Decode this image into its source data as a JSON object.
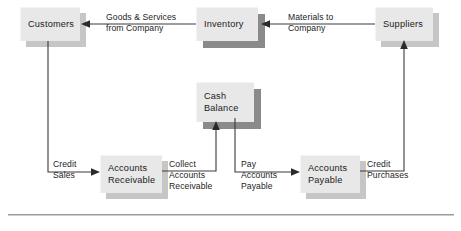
{
  "diagram": {
    "colors": {
      "box_face": "#e8e8e8",
      "box_shadow_light": "#c6c6c6",
      "box_shadow_dark": "#8a8a8a",
      "line": "#3a3a3a",
      "text": "#1b1b1b",
      "rule": "#9a9a9a",
      "background": "#ffffff"
    },
    "nodes": [
      {
        "id": "customers",
        "lines": [
          "Customers"
        ],
        "x": 20,
        "y": 7,
        "w": 60,
        "h": 34,
        "shadow": "light"
      },
      {
        "id": "inventory",
        "lines": [
          "Inventory"
        ],
        "x": 196,
        "y": 7,
        "w": 62,
        "h": 34,
        "shadow": "dark"
      },
      {
        "id": "suppliers",
        "lines": [
          "Suppliers"
        ],
        "x": 375,
        "y": 7,
        "w": 58,
        "h": 34,
        "shadow": "light"
      },
      {
        "id": "cash-balance",
        "lines": [
          "Cash",
          "Balance"
        ],
        "x": 196,
        "y": 82,
        "w": 58,
        "h": 40,
        "shadow": "dark"
      },
      {
        "id": "accounts-receivable",
        "lines": [
          "Accounts",
          "Receivable"
        ],
        "x": 100,
        "y": 155,
        "w": 62,
        "h": 38,
        "shadow": "light"
      },
      {
        "id": "accounts-payable",
        "lines": [
          "Accounts",
          "Payable"
        ],
        "x": 300,
        "y": 155,
        "w": 60,
        "h": 38,
        "shadow": "light"
      }
    ],
    "edge_labels": [
      {
        "id": "goods-and-services-from-company",
        "lines": [
          "Goods & Services",
          "from Company"
        ],
        "x": 106,
        "y": 13
      },
      {
        "id": "materials-to-company",
        "lines": [
          "Materials to",
          "Company"
        ],
        "x": 288,
        "y": 13
      },
      {
        "id": "credit-sales",
        "lines": [
          "Credit",
          "Sales"
        ],
        "x": 52,
        "y": 158
      },
      {
        "id": "collect-accounts-receivable",
        "lines": [
          "Collect",
          "Accounts",
          "Receivable"
        ],
        "x": 170,
        "y": 158
      },
      {
        "id": "pay-accounts-payable",
        "lines": [
          "Pay",
          "Accounts",
          "Payable"
        ],
        "x": 241,
        "y": 158
      },
      {
        "id": "credit-purchases",
        "lines": [
          "Credit",
          "Purchases"
        ],
        "x": 368,
        "y": 158
      }
    ],
    "edges": [
      {
        "id": "inventory-to-customers",
        "from": "inventory",
        "to": "customers",
        "label": "Goods & Services from Company",
        "path": "M 196 24 L 84 24",
        "arrow_at": "end",
        "arrow_dir": "left"
      },
      {
        "id": "suppliers-to-inventory",
        "from": "suppliers",
        "to": "inventory",
        "label": "Materials to Company",
        "path": "M 375 24 L 265 24",
        "arrow_at": "end",
        "arrow_dir": "left"
      },
      {
        "id": "customers-to-accounts-receivable",
        "from": "customers",
        "to": "accounts-receivable",
        "label": "Credit Sales",
        "path": "M 48 41 L 48 172 L 96 172",
        "arrow_at": "end",
        "arrow_dir": "right"
      },
      {
        "id": "accounts-receivable-to-cash-balance",
        "from": "accounts-receivable",
        "to": "cash-balance",
        "label": "Collect Accounts Receivable",
        "path": "M 162 171 L 216 171 L 216 126",
        "arrow_at": "end",
        "arrow_dir": "up"
      },
      {
        "id": "cash-balance-to-accounts-payable",
        "from": "cash-balance",
        "to": "accounts-payable",
        "label": "Pay Accounts Payable",
        "path": "M 235 122 L 235 172 L 296 172",
        "arrow_at": "end",
        "arrow_dir": "right"
      },
      {
        "id": "accounts-payable-to-suppliers",
        "from": "accounts-payable",
        "to": "suppliers",
        "label": "Credit Purchases",
        "path": "M 360 171 L 404 171 L 404 45",
        "arrow_at": "end",
        "arrow_dir": "up"
      }
    ],
    "footer_rule": {
      "x": 8,
      "y": 214,
      "w": 446
    }
  }
}
